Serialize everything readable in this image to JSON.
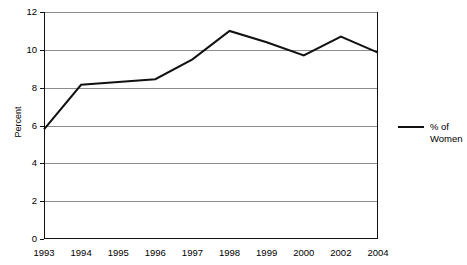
{
  "chart_data": {
    "type": "line",
    "title": "",
    "xlabel": "",
    "ylabel": "Percent",
    "categories": [
      "1993",
      "1994",
      "1995",
      "1996",
      "1997",
      "1998",
      "1999",
      "2000",
      "2002",
      "2004"
    ],
    "series": [
      {
        "name": "% of Women",
        "values": [
          5.8,
          8.15,
          8.3,
          8.45,
          9.5,
          11.0,
          10.4,
          9.7,
          10.7,
          9.85
        ]
      }
    ],
    "ylim": [
      0,
      12
    ],
    "yticks": [
      0,
      2,
      4,
      6,
      8,
      10,
      12
    ],
    "ytick_labels": [
      "0",
      "2",
      "4",
      "6",
      "8",
      "10",
      "12"
    ],
    "grid": true,
    "legend_position": "right",
    "colors": {
      "series_line": "#111111",
      "gridline": "#8c8c8c",
      "axis": "#111111",
      "background": "#ffffff"
    }
  },
  "legend": {
    "entries": [
      {
        "label": "% of\nWomen",
        "swatch": "line-swatch"
      }
    ]
  }
}
